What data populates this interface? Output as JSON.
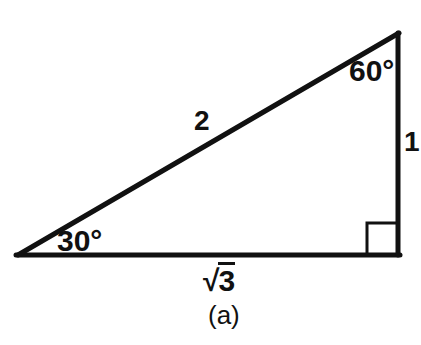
{
  "figure": {
    "caption": "(a)",
    "background_color": "#ffffff",
    "stroke_color": "#111111",
    "geometry": {
      "left_vertex": {
        "x": 18,
        "y": 255
      },
      "right_vertex": {
        "x": 398,
        "y": 255
      },
      "apex_vertex": {
        "x": 398,
        "y": 33
      },
      "base_stroke_width": 5,
      "hypotenuse_stroke_width": 5,
      "vertical_stroke_width": 5,
      "right_angle_marker": {
        "x": 367,
        "y": 222,
        "size": 31,
        "stroke_width": 3
      }
    },
    "angles": [
      {
        "id": "angle-30",
        "value": "30",
        "unit": "°",
        "text": "30°",
        "vertex": "left"
      },
      {
        "id": "angle-60",
        "value": "60",
        "unit": "°",
        "text": "60°",
        "vertex": "apex"
      },
      {
        "id": "angle-90",
        "value": "90",
        "unit": "°",
        "text": "",
        "vertex": "right"
      }
    ],
    "sides": [
      {
        "id": "hypotenuse",
        "label": "2",
        "position": "upper-middle"
      },
      {
        "id": "vertical",
        "label": "1",
        "position": "right"
      },
      {
        "id": "base",
        "label": "√3",
        "radical_sign": "√",
        "radicand": "3",
        "position": "bottom"
      }
    ]
  }
}
